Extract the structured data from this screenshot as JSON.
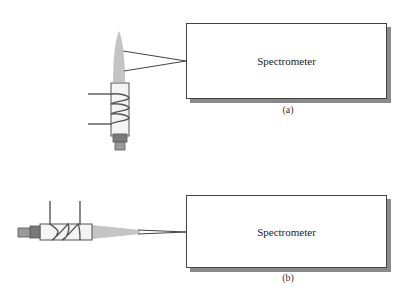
{
  "panel_a": {
    "box_label": "Spectrometer",
    "caption": "(a)",
    "orientation": "vertical-torch"
  },
  "panel_b": {
    "box_label": "Spectrometer",
    "caption": "(b)",
    "orientation": "horizontal-torch"
  },
  "colors": {
    "flame": "#c4c4c4",
    "tube": "#f4f4f4",
    "nozzle": "#8a8a8a",
    "line": "#444444",
    "shadow": "#8a8a8a"
  }
}
